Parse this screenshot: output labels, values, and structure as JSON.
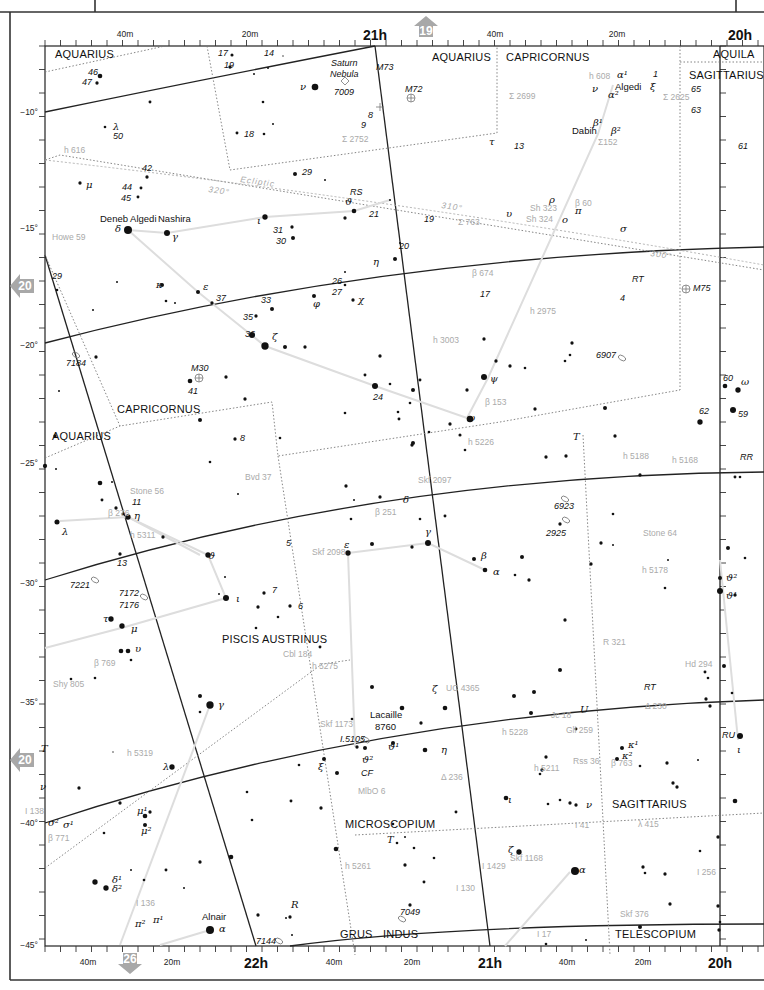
{
  "chart_title": "Star atlas chart — Capricornus / Piscis Austrinus / Microscopium region",
  "page_links": {
    "top": {
      "label": "19",
      "direction": "up",
      "x": 426,
      "y": 28
    },
    "left_upper": {
      "label": "20",
      "direction": "left",
      "x": 22,
      "y": 286
    },
    "left_lower": {
      "label": "20",
      "direction": "left",
      "x": 22,
      "y": 760
    },
    "bottom": {
      "label": "26",
      "direction": "down",
      "x": 130,
      "y": 962
    }
  },
  "axes": {
    "top_ra_labels": [
      {
        "text": "40m",
        "x": 125,
        "y": 37,
        "major": false
      },
      {
        "text": "20m",
        "x": 250,
        "y": 37,
        "major": false
      },
      {
        "text": "21h",
        "x": 375,
        "y": 40,
        "major": true
      },
      {
        "text": "40m",
        "x": 495,
        "y": 37,
        "major": false
      },
      {
        "text": "20m",
        "x": 617,
        "y": 37,
        "major": false
      },
      {
        "text": "20h",
        "x": 740,
        "y": 40,
        "major": true
      }
    ],
    "bottom_ra_labels": [
      {
        "text": "40m",
        "x": 88,
        "y": 965,
        "major": false
      },
      {
        "text": "20m",
        "x": 172,
        "y": 965,
        "major": false
      },
      {
        "text": "22h",
        "x": 256,
        "y": 968,
        "major": true
      },
      {
        "text": "40m",
        "x": 334,
        "y": 965,
        "major": false
      },
      {
        "text": "20m",
        "x": 412,
        "y": 965,
        "major": false
      },
      {
        "text": "21h",
        "x": 490,
        "y": 968,
        "major": true
      },
      {
        "text": "40m",
        "x": 567,
        "y": 965,
        "major": false
      },
      {
        "text": "20m",
        "x": 643,
        "y": 965,
        "major": false
      },
      {
        "text": "20h",
        "x": 720,
        "y": 968,
        "major": true
      }
    ],
    "dec_labels": [
      {
        "text": "−10°",
        "y": 112
      },
      {
        "text": "−15°",
        "y": 228
      },
      {
        "text": "−20°",
        "y": 345
      },
      {
        "text": "−25°",
        "y": 463
      },
      {
        "text": "−30°",
        "y": 583
      },
      {
        "text": "−35°",
        "y": 702
      },
      {
        "text": "−40°",
        "y": 823
      },
      {
        "text": "−45°",
        "y": 945
      }
    ]
  },
  "constellations": [
    {
      "name": "AQUARIUS",
      "x": 55,
      "y": 58
    },
    {
      "name": "AQUARIUS",
      "x": 432,
      "y": 61
    },
    {
      "name": "CAPRICORNUS",
      "x": 506,
      "y": 61
    },
    {
      "name": "AQUILA",
      "x": 713,
      "y": 58
    },
    {
      "name": "SAGITTARIUS",
      "x": 689,
      "y": 79
    },
    {
      "name": "CAPRICORNUS",
      "x": 117,
      "y": 413
    },
    {
      "name": "AQUARIUS",
      "x": 52,
      "y": 440
    },
    {
      "name": "PISCIS AUSTRINUS",
      "x": 222,
      "y": 643
    },
    {
      "name": "MICROSCOPIUM",
      "x": 345,
      "y": 828
    },
    {
      "name": "SAGITTARIUS",
      "x": 612,
      "y": 808
    },
    {
      "name": "GRUS",
      "x": 340,
      "y": 938
    },
    {
      "name": "INDUS",
      "x": 383,
      "y": 938
    },
    {
      "name": "TELESCOPIUM",
      "x": 615,
      "y": 938
    }
  ],
  "star_names": [
    {
      "text": "Deneb Algedi",
      "x": 100,
      "y": 222
    },
    {
      "text": "Nashira",
      "x": 158,
      "y": 222
    },
    {
      "text": "Algedi",
      "x": 615,
      "y": 90
    },
    {
      "text": "Dabih",
      "x": 572,
      "y": 134
    },
    {
      "text": "Alnair",
      "x": 202,
      "y": 920
    },
    {
      "text": "Lacaille",
      "x": 370,
      "y": 718
    },
    {
      "text": "8760",
      "x": 375,
      "y": 730
    }
  ],
  "nebula_labels": [
    {
      "text": "Saturn",
      "x": 331,
      "y": 66
    },
    {
      "text": "Nebula",
      "x": 330,
      "y": 77
    }
  ],
  "greek_labels": [
    {
      "text": "ν",
      "x": 300,
      "y": 90
    },
    {
      "text": "λ",
      "x": 113,
      "y": 130
    },
    {
      "text": "μ",
      "x": 86,
      "y": 188
    },
    {
      "text": "δ",
      "x": 115,
      "y": 232
    },
    {
      "text": "γ",
      "x": 172,
      "y": 240
    },
    {
      "text": "κ",
      "x": 156,
      "y": 288
    },
    {
      "text": "ε",
      "x": 203,
      "y": 290
    },
    {
      "text": "ι",
      "x": 257,
      "y": 224
    },
    {
      "text": "ϑ",
      "x": 345,
      "y": 205
    },
    {
      "text": "η",
      "x": 373,
      "y": 265
    },
    {
      "text": "φ",
      "x": 313,
      "y": 307
    },
    {
      "text": "χ",
      "x": 358,
      "y": 303
    },
    {
      "text": "ζ",
      "x": 272,
      "y": 340
    },
    {
      "text": "τ",
      "x": 489,
      "y": 145
    },
    {
      "text": "υ",
      "x": 506,
      "y": 217
    },
    {
      "text": "ρ",
      "x": 549,
      "y": 203
    },
    {
      "text": "π",
      "x": 575,
      "y": 214
    },
    {
      "text": "ο",
      "x": 562,
      "y": 223
    },
    {
      "text": "σ",
      "x": 620,
      "y": 232
    },
    {
      "text": "ψ",
      "x": 490,
      "y": 382
    },
    {
      "text": "ω",
      "x": 467,
      "y": 421
    },
    {
      "text": "ν",
      "x": 592,
      "y": 92
    },
    {
      "text": "α¹",
      "x": 617,
      "y": 78
    },
    {
      "text": "α²",
      "x": 608,
      "y": 98
    },
    {
      "text": "β¹",
      "x": 593,
      "y": 126
    },
    {
      "text": "β²",
      "x": 611,
      "y": 134
    },
    {
      "text": "ξ",
      "x": 650,
      "y": 90
    },
    {
      "text": "ω",
      "x": 741,
      "y": 385
    },
    {
      "text": "ϑ²",
      "x": 726,
      "y": 581
    },
    {
      "text": "ϑ¹",
      "x": 726,
      "y": 599
    },
    {
      "text": "η",
      "x": 134,
      "y": 519
    },
    {
      "text": "λ",
      "x": 62,
      "y": 535
    },
    {
      "text": "ϑ",
      "x": 208,
      "y": 559
    },
    {
      "text": "ε",
      "x": 344,
      "y": 548
    },
    {
      "text": "δ",
      "x": 403,
      "y": 503
    },
    {
      "text": "γ",
      "x": 425,
      "y": 535
    },
    {
      "text": "β",
      "x": 481,
      "y": 559
    },
    {
      "text": "α",
      "x": 493,
      "y": 575
    },
    {
      "text": "ι",
      "x": 236,
      "y": 602
    },
    {
      "text": "τ",
      "x": 103,
      "y": 622
    },
    {
      "text": "μ",
      "x": 131,
      "y": 632
    },
    {
      "text": "υ",
      "x": 135,
      "y": 652
    },
    {
      "text": "γ",
      "x": 218,
      "y": 708
    },
    {
      "text": "ζ",
      "x": 432,
      "y": 692
    },
    {
      "text": "ϑ¹",
      "x": 388,
      "y": 750
    },
    {
      "text": "ϑ²",
      "x": 362,
      "y": 763
    },
    {
      "text": "η",
      "x": 441,
      "y": 753
    },
    {
      "text": "ξ",
      "x": 318,
      "y": 770
    },
    {
      "text": "λ",
      "x": 163,
      "y": 770
    },
    {
      "text": "ν",
      "x": 40,
      "y": 790
    },
    {
      "text": "μ¹",
      "x": 137,
      "y": 814
    },
    {
      "text": "μ²",
      "x": 141,
      "y": 834
    },
    {
      "text": "σ²",
      "x": 48,
      "y": 826
    },
    {
      "text": "σ¹",
      "x": 63,
      "y": 828
    },
    {
      "text": "δ¹",
      "x": 112,
      "y": 883
    },
    {
      "text": "δ²",
      "x": 112,
      "y": 892
    },
    {
      "text": "π²",
      "x": 135,
      "y": 927
    },
    {
      "text": "π¹",
      "x": 153,
      "y": 923
    },
    {
      "text": "α",
      "x": 219,
      "y": 932
    },
    {
      "text": "ι",
      "x": 508,
      "y": 803
    },
    {
      "text": "ν",
      "x": 586,
      "y": 808
    },
    {
      "text": "ζ",
      "x": 508,
      "y": 853
    },
    {
      "text": "α",
      "x": 579,
      "y": 873
    },
    {
      "text": "κ¹",
      "x": 628,
      "y": 748
    },
    {
      "text": "κ²",
      "x": 622,
      "y": 759
    },
    {
      "text": "ι",
      "x": 737,
      "y": 753
    },
    {
      "text": "T",
      "x": 41,
      "y": 752
    },
    {
      "text": "T",
      "x": 573,
      "y": 440
    },
    {
      "text": "T",
      "x": 387,
      "y": 843
    },
    {
      "text": "U",
      "x": 580,
      "y": 713
    },
    {
      "text": "R",
      "x": 291,
      "y": 908
    }
  ],
  "number_labels": [
    {
      "text": "46",
      "x": 88,
      "y": 75
    },
    {
      "text": "47",
      "x": 82,
      "y": 85
    },
    {
      "text": "17",
      "x": 218,
      "y": 56
    },
    {
      "text": "19",
      "x": 224,
      "y": 68
    },
    {
      "text": "14",
      "x": 264,
      "y": 56
    },
    {
      "text": "7009",
      "x": 334,
      "y": 95
    },
    {
      "text": "M73",
      "x": 376,
      "y": 70
    },
    {
      "text": "M72",
      "x": 405,
      "y": 92
    },
    {
      "text": "8",
      "x": 368,
      "y": 118
    },
    {
      "text": "9",
      "x": 361,
      "y": 128
    },
    {
      "text": "50",
      "x": 113,
      "y": 139
    },
    {
      "text": "18",
      "x": 244,
      "y": 137
    },
    {
      "text": "29",
      "x": 302,
      "y": 175
    },
    {
      "text": "RS",
      "x": 350,
      "y": 195
    },
    {
      "text": "21",
      "x": 369,
      "y": 217
    },
    {
      "text": "13",
      "x": 514,
      "y": 149
    },
    {
      "text": "42",
      "x": 142,
      "y": 171
    },
    {
      "text": "44",
      "x": 122,
      "y": 190
    },
    {
      "text": "45",
      "x": 121,
      "y": 201
    },
    {
      "text": "31",
      "x": 273,
      "y": 233
    },
    {
      "text": "30",
      "x": 276,
      "y": 244
    },
    {
      "text": "19",
      "x": 424,
      "y": 222
    },
    {
      "text": "20",
      "x": 399,
      "y": 249
    },
    {
      "text": "29",
      "x": 52,
      "y": 279
    },
    {
      "text": "26",
      "x": 332,
      "y": 284
    },
    {
      "text": "27",
      "x": 332,
      "y": 295
    },
    {
      "text": "37",
      "x": 216,
      "y": 301
    },
    {
      "text": "33",
      "x": 261,
      "y": 303
    },
    {
      "text": "35",
      "x": 243,
      "y": 320
    },
    {
      "text": "36",
      "x": 245,
      "y": 337
    },
    {
      "text": "17",
      "x": 480,
      "y": 297
    },
    {
      "text": "4",
      "x": 620,
      "y": 301
    },
    {
      "text": "RT",
      "x": 632,
      "y": 282
    },
    {
      "text": "M75",
      "x": 693,
      "y": 291
    },
    {
      "text": "61",
      "x": 738,
      "y": 149
    },
    {
      "text": "65",
      "x": 691,
      "y": 92
    },
    {
      "text": "63",
      "x": 691,
      "y": 113
    },
    {
      "text": "1",
      "x": 653,
      "y": 77
    },
    {
      "text": "7184",
      "x": 66,
      "y": 366
    },
    {
      "text": "M30",
      "x": 191,
      "y": 371
    },
    {
      "text": "41",
      "x": 188,
      "y": 394
    },
    {
      "text": "24",
      "x": 373,
      "y": 400
    },
    {
      "text": "6907",
      "x": 596,
      "y": 358
    },
    {
      "text": "60",
      "x": 723,
      "y": 381
    },
    {
      "text": "59",
      "x": 738,
      "y": 417
    },
    {
      "text": "62",
      "x": 699,
      "y": 414
    },
    {
      "text": "RR",
      "x": 740,
      "y": 460
    },
    {
      "text": "8",
      "x": 240,
      "y": 441
    },
    {
      "text": "11",
      "x": 132,
      "y": 505
    },
    {
      "text": "13",
      "x": 117,
      "y": 566
    },
    {
      "text": "5",
      "x": 286,
      "y": 546
    },
    {
      "text": "6923",
      "x": 554,
      "y": 509
    },
    {
      "text": "2925",
      "x": 546,
      "y": 536
    },
    {
      "text": "7221",
      "x": 70,
      "y": 588
    },
    {
      "text": "7172",
      "x": 119,
      "y": 596
    },
    {
      "text": "7176",
      "x": 119,
      "y": 608
    },
    {
      "text": "7",
      "x": 272,
      "y": 593
    },
    {
      "text": "6",
      "x": 298,
      "y": 609
    },
    {
      "text": "RT",
      "x": 644,
      "y": 690
    },
    {
      "text": "I.5105",
      "x": 340,
      "y": 742
    },
    {
      "text": "CF",
      "x": 361,
      "y": 776
    },
    {
      "text": "RU",
      "x": 722,
      "y": 738
    },
    {
      "text": "7049",
      "x": 400,
      "y": 915
    },
    {
      "text": "7144",
      "x": 256,
      "y": 944
    }
  ],
  "double_star_labels": [
    {
      "text": "h 616",
      "x": 64,
      "y": 153
    },
    {
      "text": "Σ 2752",
      "x": 342,
      "y": 142
    },
    {
      "text": "Σ 2699",
      "x": 509,
      "y": 99
    },
    {
      "text": "h 608",
      "x": 589,
      "y": 79
    },
    {
      "text": "Σ 2625",
      "x": 663,
      "y": 100
    },
    {
      "text": "Σ152",
      "x": 598,
      "y": 145
    },
    {
      "text": "β 60",
      "x": 575,
      "y": 206
    },
    {
      "text": "Sh 323",
      "x": 530,
      "y": 211
    },
    {
      "text": "Sh 324",
      "x": 526,
      "y": 222
    },
    {
      "text": "Σ 763",
      "x": 458,
      "y": 225
    },
    {
      "text": "Howe 59",
      "x": 52,
      "y": 240
    },
    {
      "text": "β 674",
      "x": 472,
      "y": 276
    },
    {
      "text": "h 2975",
      "x": 530,
      "y": 314
    },
    {
      "text": "h 3003",
      "x": 433,
      "y": 343
    },
    {
      "text": "β 153",
      "x": 485,
      "y": 405
    },
    {
      "text": "h 5226",
      "x": 468,
      "y": 445
    },
    {
      "text": "h 5188",
      "x": 623,
      "y": 459
    },
    {
      "text": "h 5168",
      "x": 672,
      "y": 463
    },
    {
      "text": "Bvd 37",
      "x": 245,
      "y": 480
    },
    {
      "text": "Stone 56",
      "x": 130,
      "y": 494
    },
    {
      "text": "β 276",
      "x": 108,
      "y": 516
    },
    {
      "text": "h 5311",
      "x": 130,
      "y": 538
    },
    {
      "text": "Skf 2097",
      "x": 418,
      "y": 483
    },
    {
      "text": "β 251",
      "x": 375,
      "y": 515
    },
    {
      "text": "Skf 2098",
      "x": 312,
      "y": 555
    },
    {
      "text": "Stone 64",
      "x": 643,
      "y": 536
    },
    {
      "text": "h 5178",
      "x": 642,
      "y": 573
    },
    {
      "text": "R 321",
      "x": 603,
      "y": 645
    },
    {
      "text": "Cbl 184",
      "x": 283,
      "y": 657
    },
    {
      "text": "h 5275",
      "x": 312,
      "y": 669
    },
    {
      "text": "β 769",
      "x": 94,
      "y": 666
    },
    {
      "text": "Shy 805",
      "x": 53,
      "y": 687
    },
    {
      "text": "Hd 294",
      "x": 685,
      "y": 667
    },
    {
      "text": "UC 4365",
      "x": 446,
      "y": 691
    },
    {
      "text": "Δ 230",
      "x": 645,
      "y": 709
    },
    {
      "text": "Skf 1173",
      "x": 320,
      "y": 727
    },
    {
      "text": "Jc 18",
      "x": 551,
      "y": 718
    },
    {
      "text": "h 5228",
      "x": 502,
      "y": 735
    },
    {
      "text": "Gli 259",
      "x": 566,
      "y": 733
    },
    {
      "text": "h 5319",
      "x": 127,
      "y": 756
    },
    {
      "text": "MlbO 6",
      "x": 358,
      "y": 794
    },
    {
      "text": "Δ 236",
      "x": 441,
      "y": 780
    },
    {
      "text": "h 5211",
      "x": 534,
      "y": 771
    },
    {
      "text": "Rss 36",
      "x": 573,
      "y": 764
    },
    {
      "text": "β 763",
      "x": 611,
      "y": 766
    },
    {
      "text": "I 138",
      "x": 25,
      "y": 814
    },
    {
      "text": "β 771",
      "x": 48,
      "y": 841
    },
    {
      "text": "I 41",
      "x": 575,
      "y": 828
    },
    {
      "text": "λ 415",
      "x": 638,
      "y": 827
    },
    {
      "text": "Skf 1168",
      "x": 510,
      "y": 861
    },
    {
      "text": "I 1429",
      "x": 482,
      "y": 869
    },
    {
      "text": "h 5261",
      "x": 345,
      "y": 869
    },
    {
      "text": "I 130",
      "x": 456,
      "y": 891
    },
    {
      "text": "I 256",
      "x": 697,
      "y": 875
    },
    {
      "text": "I 136",
      "x": 136,
      "y": 906
    },
    {
      "text": "Skf 376",
      "x": 620,
      "y": 917
    },
    {
      "text": "I 17",
      "x": 537,
      "y": 937
    }
  ],
  "ecliptic_labels": [
    {
      "text": "Ecliptic",
      "x": 240,
      "y": 182,
      "rotate": 8
    },
    {
      "text": "320°",
      "x": 208,
      "y": 192,
      "rotate": 8
    },
    {
      "text": "310°",
      "x": 441,
      "y": 208,
      "rotate": 8
    },
    {
      "text": "300°",
      "x": 650,
      "y": 256,
      "rotate": 8
    }
  ],
  "colors": {
    "ink": "#111111",
    "grid": "#222222",
    "boundary": "#777777",
    "double_star_label": "#aaaaaa",
    "figure_line": "#dddddd",
    "page_arrow": "#a8a8a8"
  }
}
